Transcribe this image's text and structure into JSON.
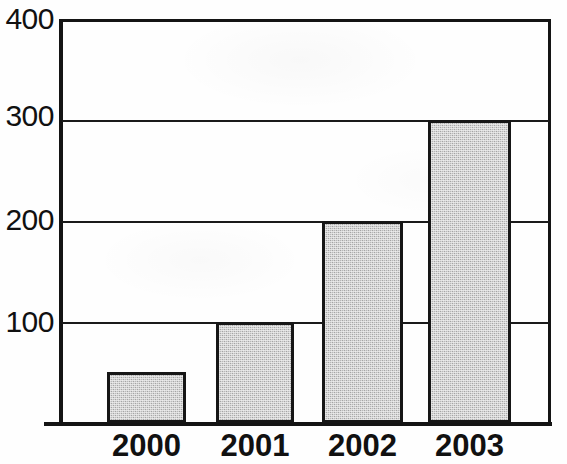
{
  "chart_data": {
    "type": "bar",
    "title": "",
    "subtitle": "",
    "xlabel": "",
    "ylabel": "",
    "categories": [
      "2000",
      "2001",
      "2002",
      "2003"
    ],
    "values": [
      50,
      100,
      200,
      300
    ],
    "series": [
      {
        "name": "",
        "values": [
          50,
          100,
          200,
          300
        ]
      }
    ],
    "ylim": [
      0,
      400
    ],
    "yticks": [
      100,
      200,
      300,
      400
    ],
    "ytick_labels": [
      "100",
      "200",
      "300",
      "400"
    ],
    "grid": true,
    "grid_axis": "y",
    "legend": false,
    "legend_position": "none",
    "bar_fill_color": "#b9b9b9",
    "bar_edge_color": "#161616",
    "axis_color": "#141414",
    "background_color": "#ffffff",
    "annotations": []
  },
  "axis": {
    "y_ticks": [
      {
        "label": "400",
        "value": 400
      },
      {
        "label": "300",
        "value": 300
      },
      {
        "label": "200",
        "value": 200
      },
      {
        "label": "100",
        "value": 100
      }
    ],
    "x_ticks": [
      {
        "label": "2000"
      },
      {
        "label": "2001"
      },
      {
        "label": "2002"
      },
      {
        "label": "2003"
      }
    ]
  },
  "bars": [
    {
      "category": "2000",
      "value": 50
    },
    {
      "category": "2001",
      "value": 100
    },
    {
      "category": "2002",
      "value": 200
    },
    {
      "category": "2003",
      "value": 300
    }
  ]
}
